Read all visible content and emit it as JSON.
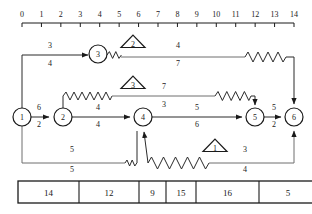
{
  "axis": {
    "name": "top-number-axis",
    "ticks": [
      "0",
      "1",
      "2",
      "3",
      "4",
      "5",
      "6",
      "7",
      "8",
      "9",
      "10",
      "11",
      "12",
      "13",
      "14"
    ],
    "min": 0,
    "max": 14
  },
  "nodes": [
    {
      "id": "1",
      "label": "1",
      "cx": 22,
      "cy": 117
    },
    {
      "id": "2",
      "label": "2",
      "cx": 63,
      "cy": 117
    },
    {
      "id": "3",
      "label": "3",
      "cx": 98,
      "cy": 54
    },
    {
      "id": "4",
      "label": "4",
      "cx": 143,
      "cy": 117
    },
    {
      "id": "5",
      "label": "5",
      "cx": 255,
      "cy": 117
    },
    {
      "id": "6",
      "label": "6",
      "cx": 294,
      "cy": 117
    }
  ],
  "triangles": [
    {
      "id": "tri-2",
      "label": "2",
      "cx": 133,
      "cy": 42
    },
    {
      "id": "tri-3",
      "label": "3",
      "cx": 133,
      "cy": 83
    },
    {
      "id": "tri-1",
      "label": "1",
      "cx": 215,
      "cy": 146
    }
  ],
  "edge_labels": [
    {
      "id": "edge-1-3",
      "top": "3",
      "bottom": "4",
      "x": 50,
      "ytop": 48,
      "ybottom": 66
    },
    {
      "id": "edge-3-6",
      "top": "4",
      "bottom": "7",
      "x": 178,
      "ytop": 48,
      "ybottom": 66
    },
    {
      "id": "edge-2-5",
      "top": "7",
      "bottom": "3",
      "x": 164,
      "ytop": 89,
      "ybottom": 107
    },
    {
      "id": "edge-1-2",
      "top": "6",
      "bottom": "2",
      "x": 39,
      "ytop": 110,
      "ybottom": 127
    },
    {
      "id": "edge-2-4",
      "top": "4",
      "bottom": "4",
      "x": 98,
      "ytop": 110,
      "ybottom": 127
    },
    {
      "id": "edge-4-5",
      "top": "5",
      "bottom": "6",
      "x": 197,
      "ytop": 110,
      "ybottom": 127
    },
    {
      "id": "edge-5-6",
      "top": "5",
      "bottom": "2",
      "x": 274,
      "ytop": 110,
      "ybottom": 127
    },
    {
      "id": "edge-1-4b",
      "top": "5",
      "bottom": "5",
      "x": 72,
      "ytop": 152,
      "ybottom": 172
    },
    {
      "id": "edge-4-6b",
      "top": "3",
      "bottom": "4",
      "x": 245,
      "ytop": 152,
      "ybottom": 172
    }
  ],
  "table": {
    "name": "values-table",
    "cells": [
      "14",
      "12",
      "9",
      "15",
      "16",
      "5",
      "12",
      "8"
    ],
    "widths": [
      61,
      60,
      27,
      30,
      63,
      58,
      59,
      55
    ]
  },
  "colors": {
    "ink": "#1a1a1a",
    "line": "#2b2b2b",
    "faint": "#6e6e6e",
    "paper": "#ffffff"
  }
}
